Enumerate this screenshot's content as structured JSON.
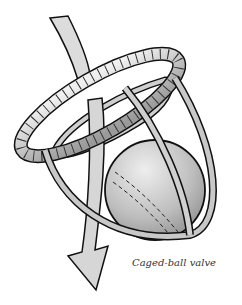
{
  "figure": {
    "caption": "Caged-ball valve",
    "parts": [
      "flow-arrow",
      "valve-ring",
      "cage",
      "ball"
    ],
    "colors": {
      "background": "#ffffff",
      "outline": "#111111",
      "metal": "#b8b8b8",
      "metal_light": "#e6e6e6",
      "ball": "#bcbcbc",
      "arrow": "#d9d9d9"
    }
  }
}
